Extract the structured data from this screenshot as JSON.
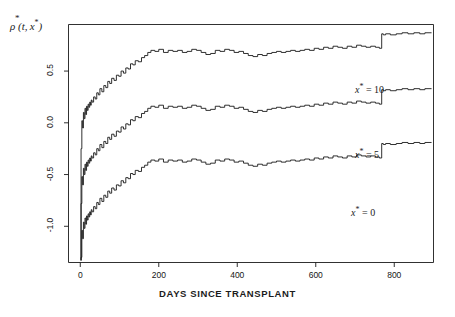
{
  "chart_data": {
    "type": "line",
    "title": "",
    "subtitle": "",
    "xlabel": "DAYS SINCE TRANSPLANT",
    "ylabel": "ρ̂ (t, x*)",
    "ylabel_parts": {
      "symbol": "ρ",
      "hat": "*",
      "args": "(t, x*)"
    },
    "xlim": [
      -30,
      900
    ],
    "ylim": [
      -1.35,
      0.95
    ],
    "xticks": [
      0,
      200,
      400,
      600,
      800
    ],
    "xtick_labels": [
      "0",
      "200",
      "400",
      "600",
      "800"
    ],
    "yticks": [
      0.5,
      0.0,
      -0.5,
      -1.0
    ],
    "ytick_labels": [
      "0.5",
      "0.0",
      "-0.5",
      "-1.0"
    ],
    "grid": false,
    "legend": "inline-annotations",
    "line_color": "#1a1a1a",
    "line_width": 0.9,
    "step_style": "post",
    "annotations": [
      {
        "text": "x* = 10",
        "series": "x_star_10",
        "x": 700,
        "y": 0.33
      },
      {
        "text": "x* = 5",
        "series": "x_star_5",
        "x": 700,
        "y": -0.3
      },
      {
        "text": "x* = 0",
        "series": "x_star_0",
        "x": 690,
        "y": -0.86
      }
    ],
    "series": [
      {
        "name": "x_star_10",
        "label": "x* = 10",
        "x": [
          2,
          4,
          6,
          8,
          10,
          12,
          14,
          16,
          18,
          20,
          22,
          24,
          26,
          28,
          30,
          34,
          38,
          42,
          46,
          50,
          55,
          60,
          65,
          70,
          75,
          80,
          86,
          92,
          98,
          104,
          110,
          116,
          122,
          128,
          134,
          140,
          148,
          156,
          164,
          172,
          180,
          190,
          200,
          212,
          224,
          236,
          248,
          260,
          272,
          284,
          296,
          308,
          320,
          332,
          344,
          356,
          368,
          380,
          392,
          404,
          416,
          428,
          440,
          452,
          464,
          476,
          488,
          500,
          512,
          524,
          536,
          548,
          560,
          572,
          584,
          596,
          608,
          620,
          632,
          644,
          656,
          668,
          680,
          692,
          704,
          716,
          728,
          740,
          752,
          762,
          768,
          772,
          778,
          790,
          805,
          820,
          835,
          850,
          865,
          878
        ],
        "y": [
          -0.25,
          0.02,
          -0.05,
          0.1,
          0.04,
          0.14,
          0.08,
          0.16,
          0.12,
          0.18,
          0.15,
          0.2,
          0.17,
          0.22,
          0.2,
          0.25,
          0.23,
          0.29,
          0.27,
          0.33,
          0.3,
          0.36,
          0.34,
          0.4,
          0.38,
          0.43,
          0.41,
          0.46,
          0.45,
          0.5,
          0.48,
          0.53,
          0.52,
          0.57,
          0.56,
          0.6,
          0.59,
          0.63,
          0.65,
          0.68,
          0.7,
          0.69,
          0.71,
          0.68,
          0.7,
          0.69,
          0.7,
          0.68,
          0.69,
          0.71,
          0.7,
          0.68,
          0.66,
          0.67,
          0.7,
          0.69,
          0.71,
          0.7,
          0.68,
          0.69,
          0.67,
          0.65,
          0.64,
          0.66,
          0.65,
          0.67,
          0.68,
          0.69,
          0.68,
          0.69,
          0.7,
          0.69,
          0.7,
          0.71,
          0.7,
          0.72,
          0.71,
          0.73,
          0.72,
          0.74,
          0.73,
          0.72,
          0.74,
          0.73,
          0.75,
          0.74,
          0.73,
          0.74,
          0.73,
          0.72,
          0.86,
          0.85,
          0.86,
          0.85,
          0.86,
          0.87,
          0.86,
          0.87,
          0.86,
          0.87
        ]
      },
      {
        "name": "x_star_5",
        "label": "x* = 5",
        "x": [
          2,
          4,
          6,
          8,
          10,
          12,
          14,
          16,
          18,
          20,
          22,
          24,
          26,
          28,
          30,
          34,
          38,
          42,
          46,
          50,
          55,
          60,
          65,
          70,
          75,
          80,
          86,
          92,
          98,
          104,
          110,
          116,
          122,
          128,
          134,
          140,
          148,
          156,
          164,
          172,
          180,
          190,
          200,
          212,
          224,
          236,
          248,
          260,
          272,
          284,
          296,
          308,
          320,
          332,
          344,
          356,
          368,
          380,
          392,
          404,
          416,
          428,
          440,
          452,
          464,
          476,
          488,
          500,
          512,
          524,
          536,
          548,
          560,
          572,
          584,
          596,
          608,
          620,
          632,
          644,
          656,
          668,
          680,
          692,
          704,
          716,
          728,
          740,
          752,
          762,
          768,
          772,
          778,
          790,
          805,
          820,
          835,
          850,
          865,
          878
        ],
        "y": [
          -0.78,
          -0.52,
          -0.6,
          -0.44,
          -0.5,
          -0.4,
          -0.46,
          -0.38,
          -0.42,
          -0.36,
          -0.39,
          -0.34,
          -0.37,
          -0.32,
          -0.34,
          -0.29,
          -0.31,
          -0.25,
          -0.27,
          -0.21,
          -0.24,
          -0.18,
          -0.2,
          -0.14,
          -0.16,
          -0.11,
          -0.13,
          -0.08,
          -0.09,
          -0.04,
          -0.06,
          -0.01,
          -0.02,
          0.03,
          0.02,
          0.06,
          0.05,
          0.09,
          0.11,
          0.14,
          0.16,
          0.15,
          0.17,
          0.14,
          0.16,
          0.15,
          0.16,
          0.14,
          0.15,
          0.17,
          0.16,
          0.14,
          0.12,
          0.13,
          0.16,
          0.15,
          0.17,
          0.16,
          0.14,
          0.15,
          0.13,
          0.11,
          0.1,
          0.12,
          0.11,
          0.13,
          0.14,
          0.15,
          0.14,
          0.15,
          0.16,
          0.15,
          0.16,
          0.17,
          0.16,
          0.18,
          0.17,
          0.19,
          0.18,
          0.2,
          0.19,
          0.18,
          0.2,
          0.19,
          0.21,
          0.2,
          0.19,
          0.2,
          0.19,
          0.18,
          0.32,
          0.31,
          0.32,
          0.31,
          0.32,
          0.33,
          0.32,
          0.33,
          0.32,
          0.33
        ]
      },
      {
        "name": "x_star_0",
        "label": "x* = 0",
        "x": [
          2,
          4,
          6,
          8,
          10,
          12,
          14,
          16,
          18,
          20,
          22,
          24,
          26,
          28,
          30,
          34,
          38,
          42,
          46,
          50,
          55,
          60,
          65,
          70,
          75,
          80,
          86,
          92,
          98,
          104,
          110,
          116,
          122,
          128,
          134,
          140,
          148,
          156,
          164,
          172,
          180,
          190,
          200,
          212,
          224,
          236,
          248,
          260,
          272,
          284,
          296,
          308,
          320,
          332,
          344,
          356,
          368,
          380,
          392,
          404,
          416,
          428,
          440,
          452,
          464,
          476,
          488,
          500,
          512,
          524,
          536,
          548,
          560,
          572,
          584,
          596,
          608,
          620,
          632,
          644,
          656,
          668,
          680,
          692,
          704,
          716,
          728,
          740,
          752,
          762,
          768,
          772,
          778,
          790,
          805,
          820,
          835,
          850,
          865,
          878
        ],
        "y": [
          -1.3,
          -1.04,
          -1.12,
          -0.96,
          -1.02,
          -0.92,
          -0.98,
          -0.9,
          -0.94,
          -0.88,
          -0.91,
          -0.86,
          -0.89,
          -0.84,
          -0.86,
          -0.81,
          -0.83,
          -0.77,
          -0.79,
          -0.73,
          -0.76,
          -0.7,
          -0.72,
          -0.66,
          -0.68,
          -0.63,
          -0.65,
          -0.6,
          -0.61,
          -0.56,
          -0.58,
          -0.53,
          -0.54,
          -0.49,
          -0.5,
          -0.46,
          -0.47,
          -0.43,
          -0.41,
          -0.38,
          -0.36,
          -0.37,
          -0.35,
          -0.38,
          -0.36,
          -0.37,
          -0.36,
          -0.38,
          -0.37,
          -0.35,
          -0.36,
          -0.38,
          -0.4,
          -0.39,
          -0.36,
          -0.37,
          -0.35,
          -0.36,
          -0.38,
          -0.37,
          -0.39,
          -0.41,
          -0.42,
          -0.4,
          -0.41,
          -0.39,
          -0.38,
          -0.37,
          -0.38,
          -0.37,
          -0.36,
          -0.37,
          -0.36,
          -0.35,
          -0.36,
          -0.34,
          -0.35,
          -0.33,
          -0.34,
          -0.32,
          -0.33,
          -0.34,
          -0.32,
          -0.33,
          -0.31,
          -0.32,
          -0.33,
          -0.32,
          -0.33,
          -0.34,
          -0.2,
          -0.21,
          -0.2,
          -0.21,
          -0.2,
          -0.19,
          -0.2,
          -0.19,
          -0.2,
          -0.19
        ]
      }
    ]
  }
}
